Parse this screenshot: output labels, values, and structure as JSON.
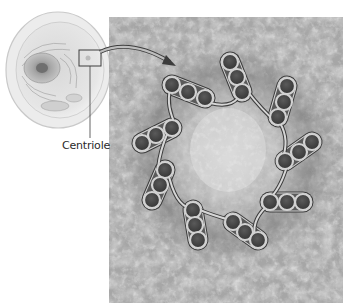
{
  "figure": {
    "callout_label": "Centriole",
    "panels": {
      "cell_illustration": "animal-cell-illustration",
      "micrograph": "centriole-cross-section-micrograph"
    },
    "structure": {
      "triplet_count": 9,
      "tubules_per_triplet": 3
    },
    "colors": {
      "background": "#ffffff",
      "micrograph_base": "#a9a9a9",
      "tubule_ring": "#d6d6d6",
      "tubule_lumen": "#4a4a4a",
      "tubule_outline": "#3a3a3a",
      "cell_body": "#e4e4e4",
      "nucleus": "#9a9a9a",
      "label_text": "#2a2a2a"
    }
  }
}
